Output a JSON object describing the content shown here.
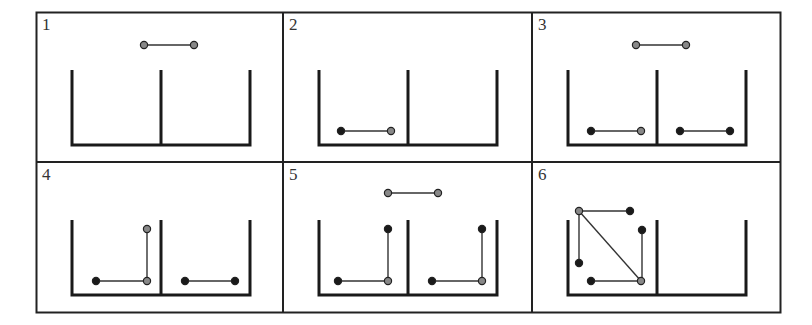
{
  "figure": {
    "grid": {
      "rows": 2,
      "cols": 3
    },
    "colors": {
      "border": "#222222",
      "container": "#1a1a1a",
      "link": "#333333",
      "dark_node": "#1a1a1a",
      "light_node": "#888888"
    },
    "panels": [
      {
        "label": "1",
        "links": [
          {
            "x1": 107,
            "y1": 32,
            "x2": 157,
            "y2": 32
          }
        ],
        "nodes": [
          {
            "x": 107,
            "y": 32,
            "type": "light"
          },
          {
            "x": 157,
            "y": 32,
            "type": "light"
          }
        ]
      },
      {
        "label": "2",
        "links": [
          {
            "x1": 57,
            "y1": 118,
            "x2": 107,
            "y2": 118
          }
        ],
        "nodes": [
          {
            "x": 57,
            "y": 118,
            "type": "dark"
          },
          {
            "x": 107,
            "y": 118,
            "type": "light"
          }
        ]
      },
      {
        "label": "3",
        "links": [
          {
            "x1": 103,
            "y1": 32,
            "x2": 153,
            "y2": 32
          },
          {
            "x1": 58,
            "y1": 118,
            "x2": 108,
            "y2": 118
          },
          {
            "x1": 147,
            "y1": 118,
            "x2": 197,
            "y2": 118
          }
        ],
        "nodes": [
          {
            "x": 103,
            "y": 32,
            "type": "light"
          },
          {
            "x": 153,
            "y": 32,
            "type": "light"
          },
          {
            "x": 58,
            "y": 118,
            "type": "dark"
          },
          {
            "x": 108,
            "y": 118,
            "type": "light"
          },
          {
            "x": 147,
            "y": 118,
            "type": "dark"
          },
          {
            "x": 197,
            "y": 118,
            "type": "dark"
          }
        ]
      },
      {
        "label": "4",
        "links": [
          {
            "x1": 59,
            "y1": 118,
            "x2": 110,
            "y2": 118
          },
          {
            "x1": 110,
            "y1": 66,
            "x2": 110,
            "y2": 118
          },
          {
            "x1": 148,
            "y1": 118,
            "x2": 198,
            "y2": 118
          }
        ],
        "nodes": [
          {
            "x": 59,
            "y": 118,
            "type": "dark"
          },
          {
            "x": 110,
            "y": 118,
            "type": "light"
          },
          {
            "x": 110,
            "y": 66,
            "type": "light"
          },
          {
            "x": 148,
            "y": 118,
            "type": "dark"
          },
          {
            "x": 198,
            "y": 118,
            "type": "dark"
          }
        ]
      },
      {
        "label": "5",
        "links": [
          {
            "x1": 104,
            "y1": 30,
            "x2": 154,
            "y2": 30
          },
          {
            "x1": 54,
            "y1": 118,
            "x2": 104,
            "y2": 118
          },
          {
            "x1": 104,
            "y1": 66,
            "x2": 104,
            "y2": 118
          },
          {
            "x1": 148,
            "y1": 118,
            "x2": 198,
            "y2": 118
          },
          {
            "x1": 198,
            "y1": 66,
            "x2": 198,
            "y2": 118
          }
        ],
        "nodes": [
          {
            "x": 104,
            "y": 30,
            "type": "light"
          },
          {
            "x": 154,
            "y": 30,
            "type": "light"
          },
          {
            "x": 54,
            "y": 118,
            "type": "dark"
          },
          {
            "x": 104,
            "y": 118,
            "type": "light"
          },
          {
            "x": 104,
            "y": 66,
            "type": "dark"
          },
          {
            "x": 148,
            "y": 118,
            "type": "dark"
          },
          {
            "x": 198,
            "y": 118,
            "type": "light"
          },
          {
            "x": 198,
            "y": 66,
            "type": "dark"
          }
        ]
      },
      {
        "label": "6",
        "links": [
          {
            "x1": 46,
            "y1": 48,
            "x2": 97,
            "y2": 48
          },
          {
            "x1": 46,
            "y1": 48,
            "x2": 46,
            "y2": 100
          },
          {
            "x1": 46,
            "y1": 48,
            "x2": 108,
            "y2": 118
          },
          {
            "x1": 58,
            "y1": 118,
            "x2": 108,
            "y2": 118
          },
          {
            "x1": 109,
            "y1": 67,
            "x2": 109,
            "y2": 118
          }
        ],
        "nodes": [
          {
            "x": 46,
            "y": 48,
            "type": "light"
          },
          {
            "x": 97,
            "y": 48,
            "type": "dark"
          },
          {
            "x": 46,
            "y": 100,
            "type": "dark"
          },
          {
            "x": 58,
            "y": 118,
            "type": "dark"
          },
          {
            "x": 108,
            "y": 118,
            "type": "light"
          },
          {
            "x": 109,
            "y": 67,
            "type": "dark"
          }
        ]
      }
    ]
  }
}
